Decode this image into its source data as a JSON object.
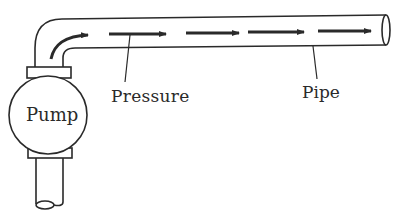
{
  "diagram": {
    "labels": {
      "pump": "Pump",
      "pressure": "Pressure",
      "pipe": "Pipe"
    },
    "colors": {
      "ink": "#2a2a2a",
      "background": "#ffffff"
    },
    "flow_arrows": 5,
    "flow_direction": "left-to-right"
  }
}
